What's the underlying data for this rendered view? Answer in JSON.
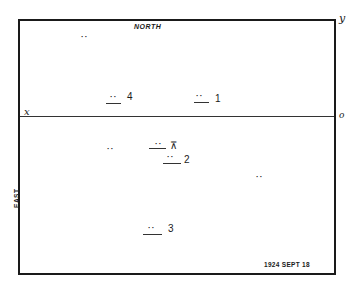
{
  "diagram": {
    "type": "star-plate-chart",
    "labels": {
      "north": "NORTH",
      "east": "EAST",
      "date": "1924 SEPT 18",
      "x_axis": "x",
      "y_axis": "y",
      "origin": "o"
    },
    "marks": [
      {
        "id": "star-1",
        "label": "1",
        "symbol": "··",
        "underlined": true
      },
      {
        "id": "star-2",
        "label": "2",
        "symbol": "··",
        "underlined": true
      },
      {
        "id": "star-3",
        "label": "3",
        "symbol": "··",
        "underlined": true
      },
      {
        "id": "star-4",
        "label": "4",
        "symbol": "··",
        "underlined": true
      },
      {
        "id": "target",
        "label": "⊼",
        "symbol": "··",
        "underlined": true
      },
      {
        "id": "field-a",
        "label": "",
        "symbol": "··",
        "underlined": false
      },
      {
        "id": "field-b",
        "label": "",
        "symbol": "··",
        "underlined": false
      },
      {
        "id": "field-c",
        "label": "",
        "symbol": "··",
        "underlined": false
      }
    ]
  }
}
